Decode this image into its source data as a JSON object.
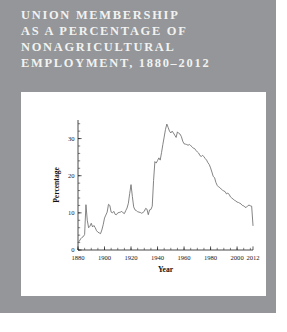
{
  "panel": {
    "background_color": "#949699",
    "card_color": "#ffffff"
  },
  "title": {
    "color": "#f2f2f0",
    "lines": [
      "UNION MEMBERSHIP",
      "AS A PERCENTAGE OF",
      "NONAGRICULTURAL",
      "EMPLOYMENT, 1880–2012"
    ],
    "full_text": "UNION MEMBERSHIP AS A PERCENTAGE OF NONAGRICULTURAL EMPLOYMENT, 1880–2012"
  },
  "chart_data": {
    "type": "line",
    "title": "UNION MEMBERSHIP AS A PERCENTAGE OF NONAGRICULTURAL EMPLOYMENT, 1880–2012",
    "xlabel": "Year",
    "ylabel": "Percentage",
    "xlim": [
      1880,
      2012
    ],
    "ylim": [
      0,
      35
    ],
    "grid": false,
    "legend": null,
    "line_color": "#6e6e6e",
    "x_ticks": [
      1880,
      1900,
      1920,
      1940,
      1960,
      1980,
      2000,
      2012
    ],
    "x_tick_labels": [
      "1880",
      "1900",
      "1920",
      "1940",
      "1960",
      "1980",
      "2000",
      "2012"
    ],
    "x_minor_tick_step": 5,
    "y_ticks": [
      0,
      10,
      20,
      30
    ],
    "y_tick_labels": [
      "0",
      "10",
      "20",
      "30"
    ],
    "y_minor_tick_step": 2,
    "series": [
      {
        "name": "Union membership share of nonagricultural employment",
        "x": [
          1880,
          1881,
          1882,
          1883,
          1884,
          1885,
          1886,
          1887,
          1888,
          1889,
          1890,
          1891,
          1892,
          1893,
          1894,
          1895,
          1896,
          1897,
          1898,
          1899,
          1900,
          1901,
          1902,
          1903,
          1904,
          1905,
          1906,
          1907,
          1908,
          1909,
          1910,
          1911,
          1912,
          1913,
          1914,
          1915,
          1916,
          1917,
          1918,
          1919,
          1920,
          1921,
          1922,
          1923,
          1924,
          1925,
          1926,
          1927,
          1928,
          1929,
          1930,
          1931,
          1932,
          1933,
          1934,
          1935,
          1936,
          1937,
          1938,
          1939,
          1940,
          1941,
          1942,
          1943,
          1944,
          1945,
          1946,
          1947,
          1948,
          1949,
          1950,
          1951,
          1952,
          1953,
          1954,
          1955,
          1956,
          1957,
          1958,
          1959,
          1960,
          1961,
          1962,
          1963,
          1964,
          1965,
          1966,
          1967,
          1968,
          1969,
          1970,
          1971,
          1972,
          1973,
          1974,
          1975,
          1976,
          1977,
          1978,
          1979,
          1980,
          1981,
          1982,
          1983,
          1984,
          1985,
          1986,
          1987,
          1988,
          1989,
          1990,
          1991,
          1992,
          1993,
          1994,
          1995,
          1996,
          1997,
          1998,
          1999,
          2000,
          2001,
          2002,
          2003,
          2004,
          2005,
          2006,
          2007,
          2008,
          2009,
          2010,
          2011,
          2012
        ],
        "values": [
          2.0,
          2.4,
          3.0,
          3.4,
          3.6,
          4.2,
          12.2,
          8.0,
          6.0,
          6.4,
          7.2,
          6.2,
          6.6,
          6.0,
          5.2,
          4.8,
          4.6,
          4.4,
          5.4,
          6.8,
          8.6,
          9.4,
          10.2,
          12.3,
          12.0,
          10.2,
          10.0,
          10.4,
          9.6,
          9.5,
          10.0,
          10.1,
          10.2,
          10.4,
          10.0,
          9.8,
          10.6,
          11.3,
          12.6,
          15.2,
          17.6,
          14.4,
          11.6,
          10.8,
          10.6,
          10.3,
          10.2,
          10.1,
          9.9,
          10.1,
          10.4,
          11.2,
          11.0,
          9.5,
          10.8,
          10.9,
          11.8,
          18.7,
          23.8,
          23.4,
          24.1,
          24.8,
          24.2,
          26.2,
          28.4,
          30.4,
          32.5,
          33.9,
          33.0,
          32.0,
          31.5,
          32.0,
          31.5,
          30.9,
          30.3,
          31.8,
          31.4,
          31.2,
          30.5,
          29.3,
          28.6,
          28.5,
          28.4,
          28.2,
          28.4,
          28.1,
          27.8,
          27.4,
          27.3,
          26.8,
          26.4,
          26.1,
          25.4,
          25.2,
          25.5,
          25.1,
          24.6,
          24.2,
          23.5,
          23.0,
          22.1,
          21.0,
          19.8,
          19.5,
          18.2,
          17.4,
          17.0,
          16.8,
          16.4,
          16.1,
          15.9,
          15.7,
          15.1,
          15.3,
          15.0,
          14.3,
          14.0,
          13.7,
          13.4,
          13.2,
          12.9,
          12.8,
          12.6,
          12.4,
          12.0,
          11.9,
          11.5,
          11.5,
          11.9,
          12.1,
          11.9,
          11.8,
          6.6
        ]
      }
    ],
    "annotations": [
      {
        "label": "1886 Knights of Labor spike",
        "year": 1886,
        "value": 12.2
      },
      {
        "label": "1920 post-WWI peak",
        "year": 1920,
        "value": 17.6
      },
      {
        "label": "1945 all-time peak",
        "year": 1945,
        "value": 33.9
      },
      {
        "label": "1954 secondary peak",
        "year": 1954,
        "value": 32.0
      },
      {
        "label": "2012 final value",
        "year": 2012,
        "value": 6.6
      }
    ]
  }
}
